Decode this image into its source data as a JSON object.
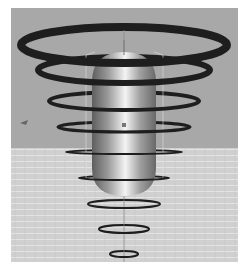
{
  "scene": {
    "description": "3D render of a capsule with concentric rings",
    "colors": {
      "background": "#a8a8a8",
      "floor": "#d2d2d2",
      "ring": "#1e1e1e",
      "capsule_light": "#f0f0f0",
      "capsule_dark": "#6a6a6a"
    },
    "rings": [
      {
        "cy": 45,
        "rx": 103,
        "ry": 18,
        "stroke": 8
      },
      {
        "cy": 70,
        "rx": 86,
        "ry": 13,
        "stroke": 6
      },
      {
        "cy": 101,
        "rx": 75,
        "ry": 9,
        "stroke": 4
      },
      {
        "cy": 127,
        "rx": 66,
        "ry": 5,
        "stroke": 3
      },
      {
        "cy": 152,
        "rx": 58,
        "ry": 2,
        "stroke": 2
      },
      {
        "cy": 178,
        "rx": 45,
        "ry": 2,
        "stroke": 2
      },
      {
        "cy": 204,
        "rx": 36,
        "ry": 4,
        "stroke": 2
      },
      {
        "cy": 229,
        "rx": 25,
        "ry": 4,
        "stroke": 2
      },
      {
        "cy": 254,
        "rx": 14,
        "ry": 3,
        "stroke": 2
      }
    ]
  }
}
